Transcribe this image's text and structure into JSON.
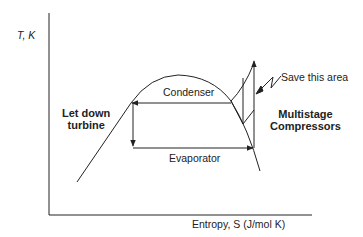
{
  "diagram": {
    "type": "T-S diagram (refrigeration cycle)",
    "axes": {
      "y_label": "T, K",
      "x_label": "Entropy, S (J/mol K)"
    },
    "labels": {
      "condenser": "Condenser",
      "evaporator": "Evaporator",
      "save_area": "Save this area",
      "let_down_line1": "Let down",
      "let_down_line2": "turbine",
      "compressor_line1": "Multistage",
      "compressor_line2": "Compressors"
    },
    "colors": {
      "line": "#222222",
      "background": "#ffffff"
    }
  }
}
